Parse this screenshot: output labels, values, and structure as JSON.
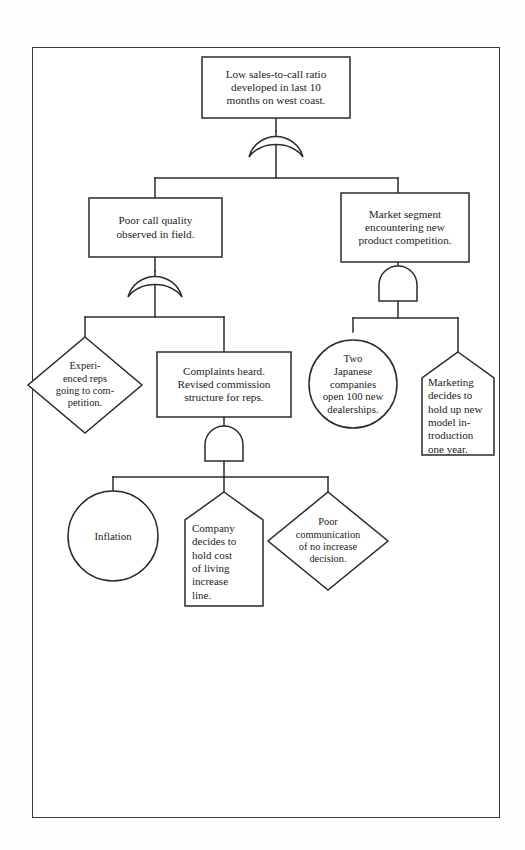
{
  "diagram": {
    "type": "fault-tree",
    "title": "",
    "frame": {
      "border_color": "#3a3a3a",
      "background": "#ffffff"
    },
    "line_color": "#2b2b2b",
    "nodes": [
      {
        "id": "top-event",
        "shape": "rectangle",
        "role": "top-event",
        "text": "Low sales-to-call ratio\ndeveloped in last 10\nmonths on west coast."
      },
      {
        "id": "poor-call-quality",
        "shape": "rectangle",
        "role": "intermediate-event",
        "text": "Poor call quality\nobserved in field."
      },
      {
        "id": "market-segment",
        "shape": "rectangle",
        "role": "intermediate-event",
        "text": "Market segment\nencountering new\nproduct competition."
      },
      {
        "id": "experienced-reps",
        "shape": "diamond",
        "role": "undeveloped-event",
        "text": "Experi-\nenced reps\ngoing to com-\npetition."
      },
      {
        "id": "complaints-heard",
        "shape": "rectangle",
        "role": "intermediate-event",
        "text": "Complaints heard.\nRevised commission\nstructure for reps."
      },
      {
        "id": "two-japanese",
        "shape": "circle",
        "role": "basic-event",
        "text": "Two\nJapanese\ncompanies\nopen 100 new\ndealerships."
      },
      {
        "id": "marketing-decides",
        "shape": "house",
        "role": "external-event",
        "text": "Marketing\ndecides to\nhold up new\nmodel in-\ntroduction\none year."
      },
      {
        "id": "inflation",
        "shape": "circle",
        "role": "basic-event",
        "text": "Inflation"
      },
      {
        "id": "company-decides",
        "shape": "house",
        "role": "external-event",
        "text": "Company\ndecides to\nhold cost\nof living\nincrease\nline."
      },
      {
        "id": "poor-communication",
        "shape": "diamond",
        "role": "undeveloped-event",
        "text": "Poor\ncommunication\nof no increase\ndecision."
      }
    ],
    "gates": [
      {
        "id": "gate-top",
        "type": "or",
        "parent": "top-event",
        "children": [
          "poor-call-quality",
          "market-segment"
        ]
      },
      {
        "id": "gate-left",
        "type": "or",
        "parent": "poor-call-quality",
        "children": [
          "experienced-reps",
          "complaints-heard"
        ]
      },
      {
        "id": "gate-right",
        "type": "and",
        "parent": "market-segment",
        "children": [
          "two-japanese",
          "marketing-decides"
        ]
      },
      {
        "id": "gate-bottom",
        "type": "and",
        "parent": "complaints-heard",
        "children": [
          "inflation",
          "company-decides",
          "poor-communication"
        ]
      }
    ]
  }
}
